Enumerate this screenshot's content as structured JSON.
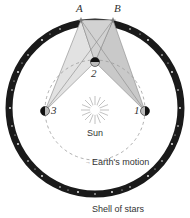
{
  "diagram": {
    "type": "stellar-parallax",
    "stars": [
      {
        "id": "A",
        "label": "A"
      },
      {
        "id": "B",
        "label": "B"
      }
    ],
    "earth_positions": [
      {
        "id": "1",
        "label": "1"
      },
      {
        "id": "2",
        "label": "2"
      },
      {
        "id": "3",
        "label": "3"
      }
    ],
    "sun_label": "Sun",
    "orbit_label": "Earth's motion",
    "shell_label": "Shell of stars"
  },
  "colors": {
    "shell": "#1a1a1a",
    "sightline_light": "#d9d9d9",
    "sightline_dark": "#bdbdbd",
    "orbit": "#9a9a9a",
    "text": "#333333"
  }
}
